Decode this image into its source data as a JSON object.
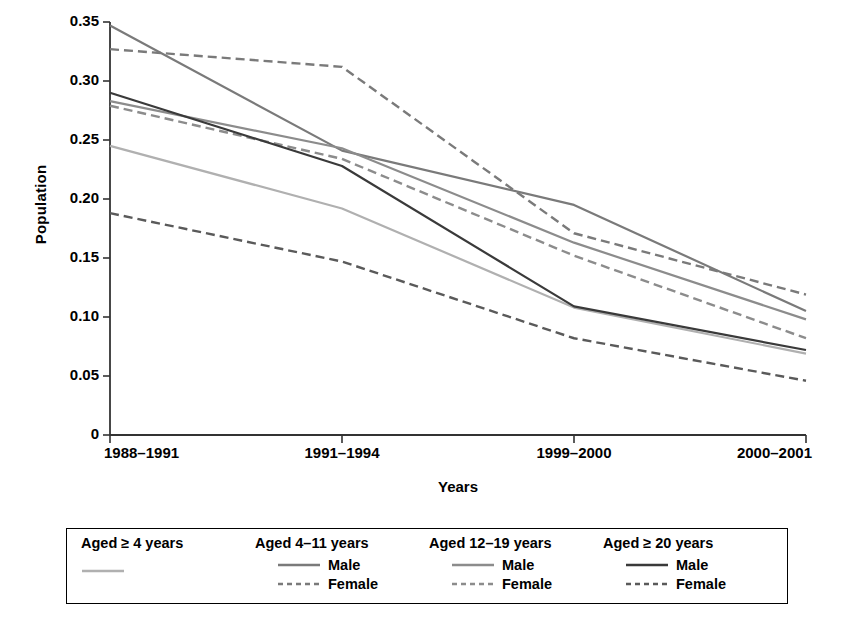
{
  "chart_data": {
    "type": "line",
    "title": "",
    "xlabel": "Years",
    "ylabel": "Population",
    "categories": [
      "1988–1991",
      "1991–1994",
      "1999–2000",
      "2000–2001"
    ],
    "ylim": [
      0,
      0.35
    ],
    "ytick_labels": [
      "0",
      "0.05",
      "0.10",
      "0.15",
      "0.20",
      "0.25",
      "0.30",
      "0.35"
    ],
    "ytick_values": [
      0,
      0.05,
      0.1,
      0.15,
      0.2,
      0.25,
      0.3,
      0.35
    ],
    "grid": false,
    "legend_position": "below-plot",
    "series": [
      {
        "name": "Aged ≥ 4 years",
        "group": "Aged ≥ 4 years",
        "sex": "",
        "style": "solid",
        "color": "#b0b0b0",
        "values": [
          0.245,
          0.192,
          0.108,
          0.069
        ]
      },
      {
        "name": "Aged 4–11 years Male",
        "group": "Aged 4–11 years",
        "sex": "Male",
        "style": "solid",
        "color": "#7a7a7a",
        "values": [
          0.347,
          0.241,
          0.195,
          0.105
        ]
      },
      {
        "name": "Aged 4–11 years Female",
        "group": "Aged 4–11 years",
        "sex": "Female",
        "style": "dashed",
        "color": "#7a7a7a",
        "values": [
          0.327,
          0.312,
          0.171,
          0.119
        ]
      },
      {
        "name": "Aged 12–19 years Male",
        "group": "Aged 12–19 years",
        "sex": "Male",
        "style": "solid",
        "color": "#8c8c8c",
        "values": [
          0.283,
          0.243,
          0.163,
          0.098
        ]
      },
      {
        "name": "Aged 12–19 years Female",
        "group": "Aged 12–19 years",
        "sex": "Female",
        "style": "dashed",
        "color": "#8c8c8c",
        "values": [
          0.279,
          0.234,
          0.152,
          0.082
        ]
      },
      {
        "name": "Aged ≥ 20 years Male",
        "group": "Aged ≥ 20 years",
        "sex": "Male",
        "style": "solid",
        "color": "#3a3a3a",
        "values": [
          0.29,
          0.228,
          0.109,
          0.072
        ]
      },
      {
        "name": "Aged ≥ 20 years Female",
        "group": "Aged ≥ 20 years",
        "sex": "Female",
        "style": "dashed",
        "color": "#5a5a5a",
        "values": [
          0.188,
          0.147,
          0.082,
          0.046
        ]
      }
    ]
  },
  "axes": {
    "y_title": "Population",
    "x_title": "Years",
    "y_ticks": [
      {
        "label": "0.35"
      },
      {
        "label": "0.30"
      },
      {
        "label": "0.25"
      },
      {
        "label": "0.20"
      },
      {
        "label": "0.15"
      },
      {
        "label": "0.10"
      },
      {
        "label": "0.05"
      },
      {
        "label": "0"
      }
    ],
    "x_ticks": [
      {
        "label": "1988–1991"
      },
      {
        "label": "1991–1994"
      },
      {
        "label": "1999–2000"
      },
      {
        "label": "2000–2001"
      }
    ]
  },
  "legend": {
    "groups": [
      {
        "title": "Aged ≥ 4 years",
        "rows": [
          {
            "label": "",
            "style": "solid",
            "color": "#b0b0b0"
          }
        ]
      },
      {
        "title": "Aged 4–11 years",
        "rows": [
          {
            "label": "Male",
            "style": "solid",
            "color": "#7a7a7a"
          },
          {
            "label": "Female",
            "style": "dashed",
            "color": "#7a7a7a"
          }
        ]
      },
      {
        "title": "Aged 12–19 years",
        "rows": [
          {
            "label": "Male",
            "style": "solid",
            "color": "#8c8c8c"
          },
          {
            "label": "Female",
            "style": "dashed",
            "color": "#8c8c8c"
          }
        ]
      },
      {
        "title": "Aged ≥ 20 years",
        "rows": [
          {
            "label": "Male",
            "style": "solid",
            "color": "#3a3a3a"
          },
          {
            "label": "Female",
            "style": "dashed",
            "color": "#5a5a5a"
          }
        ]
      }
    ]
  },
  "colors": {
    "axis": "#333333",
    "background": "#ffffff",
    "text": "#000000"
  }
}
